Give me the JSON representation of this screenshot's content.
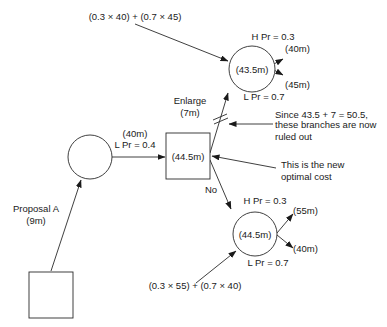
{
  "diagram": {
    "type": "decision-tree",
    "nodes": {
      "start_decision": {
        "shape": "square",
        "label": ""
      },
      "chance_a": {
        "shape": "circle",
        "label": ""
      },
      "decision_2": {
        "shape": "square",
        "label": "(44.5m)"
      },
      "chance_enlarge": {
        "shape": "circle",
        "label": "(43.5m)"
      },
      "chance_no": {
        "shape": "circle",
        "label": "(44.5m)"
      }
    },
    "branches": {
      "proposal_a": {
        "label": "Proposal A",
        "cost": "(9m)"
      },
      "low_a": {
        "value": "(40m)",
        "prob": "L Pr = 0.4"
      },
      "enlarge": {
        "label": "Enlarge",
        "cost": "(7m)"
      },
      "no": {
        "label": "No"
      },
      "enlarge_high": {
        "prob": "H Pr = 0.3",
        "value": "(40m)"
      },
      "enlarge_low": {
        "prob": "L Pr = 0.7",
        "value": "(45m)"
      },
      "no_high": {
        "prob": "H Pr = 0.3",
        "value": "(55m)"
      },
      "no_low": {
        "prob": "L Pr = 0.7",
        "value": "(40m)"
      }
    },
    "annotations": {
      "enlarge_calc": "(0.3 × 40) + (0.7 × 45)",
      "no_calc": "(0.3 × 55) + (0.7 × 40)",
      "ruled_out_line1": "Since 43.5 + 7 = 50.5,",
      "ruled_out_line2": "these branches are now",
      "ruled_out_line3": "ruled out",
      "optimal_line1": "This is the new",
      "optimal_line2": "optimal cost"
    }
  }
}
